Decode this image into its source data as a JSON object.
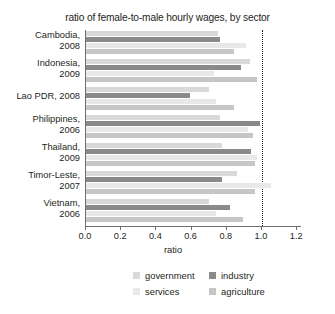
{
  "chart_data": {
    "type": "bar",
    "orientation": "horizontal",
    "title": "ratio of female-to-male hourly wages, by sector",
    "xlabel": "ratio",
    "ylabel": "",
    "xlim": [
      0.0,
      1.226
    ],
    "xticks": [
      0.0,
      0.2,
      0.4,
      0.6,
      0.8,
      1.0,
      1.2
    ],
    "xticklabels": [
      "0.0",
      "0.2",
      "0.4",
      "0.6",
      "0.8",
      "1.0",
      "1.2"
    ],
    "grid": false,
    "reference_line": {
      "value": 1.0,
      "style": "dotted",
      "color": "#231f20"
    },
    "legend_position": "bottom",
    "categories": [
      "Cambodia, 2008",
      "Indonesia, 2009",
      "Lao PDR, 2008",
      "Philippines, 2006",
      "Thailand, 2009",
      "Timor-Leste, 2007",
      "Vietnam, 2006"
    ],
    "series": [
      {
        "name": "government",
        "color": "#d9d9d9",
        "values": [
          0.75,
          0.93,
          0.7,
          0.76,
          0.77,
          0.86,
          0.7
        ]
      },
      {
        "name": "industry",
        "color": "#8a8a8a",
        "values": [
          0.76,
          0.88,
          0.59,
          0.99,
          0.94,
          0.77,
          0.82
        ]
      },
      {
        "name": "services",
        "color": "#e8e8e8",
        "values": [
          0.91,
          0.73,
          0.74,
          0.92,
          0.97,
          1.05,
          0.74
        ]
      },
      {
        "name": "agriculture",
        "color": "#c6c6c6",
        "values": [
          0.84,
          0.97,
          0.84,
          0.95,
          0.96,
          0.96,
          0.89
        ]
      }
    ]
  },
  "legend": {
    "items": [
      {
        "label": "government"
      },
      {
        "label": "industry"
      },
      {
        "label": "services"
      },
      {
        "label": "agriculture"
      }
    ]
  }
}
